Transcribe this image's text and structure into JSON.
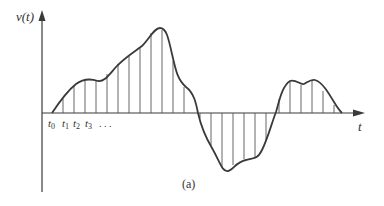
{
  "figure": {
    "y_axis_label": "v(t)",
    "x_axis_label": "t",
    "caption": "(a)",
    "sample_labels": [
      {
        "base": "t",
        "sub": "0"
      },
      {
        "base": "t",
        "sub": "1"
      },
      {
        "base": "t",
        "sub": "2"
      },
      {
        "base": "t",
        "sub": "3"
      }
    ],
    "ellipsis": ". . .",
    "colors": {
      "curve": "#3a3a3a",
      "axis": "#3a3a3a",
      "sample_lines": "#555555",
      "text": "#333333"
    }
  }
}
